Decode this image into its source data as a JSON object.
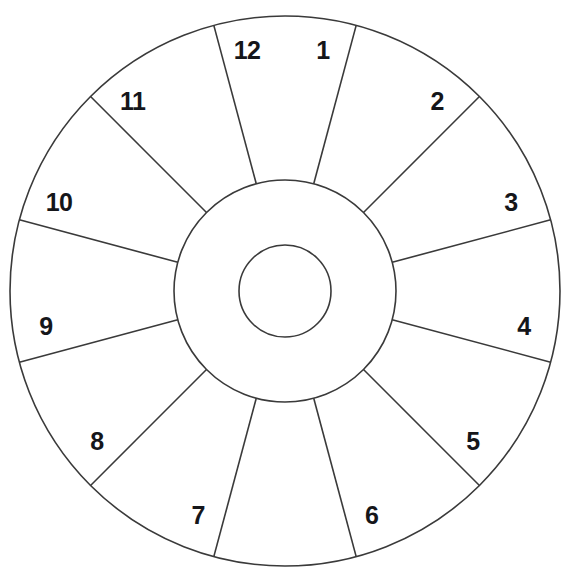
{
  "diagram": {
    "type": "radial-sector-wheel",
    "background_color": "#ffffff",
    "stroke_color": "#3a3a3a",
    "label_color": "#15161a",
    "geometry": {
      "center_x": 285,
      "center_y": 291,
      "outer_radius": 275,
      "middle_radius": 111,
      "inner_radius": 46,
      "sector_count": 12,
      "sector_angle_degrees": 30,
      "first_spoke_offset_degrees": 15
    },
    "rings": [
      {
        "name": "outer-circle",
        "radius": 275
      },
      {
        "name": "middle-circle",
        "radius": 111
      },
      {
        "name": "inner-circle",
        "radius": 46
      }
    ],
    "sectors": [
      {
        "label": "1",
        "spoke_angle_degrees": -75,
        "label_angle_degrees": -81,
        "label_anchor": "start"
      },
      {
        "label": "2",
        "spoke_angle_degrees": -45,
        "label_angle_degrees": -51,
        "label_anchor": "start"
      },
      {
        "label": "3",
        "spoke_angle_degrees": -15,
        "label_angle_degrees": -21,
        "label_anchor": "start"
      },
      {
        "label": "4",
        "spoke_angle_degrees": 15,
        "label_angle_degrees": 9,
        "label_anchor": "start"
      },
      {
        "label": "5",
        "spoke_angle_degrees": 45,
        "label_angle_degrees": 39,
        "label_anchor": "start"
      },
      {
        "label": "6",
        "spoke_angle_degrees": 75,
        "label_angle_degrees": 69,
        "label_anchor": "start"
      },
      {
        "label": "7",
        "spoke_angle_degrees": 105,
        "label_angle_degrees": 111,
        "label_anchor": "end"
      },
      {
        "label": "8",
        "spoke_angle_degrees": 135,
        "label_angle_degrees": 141,
        "label_anchor": "end"
      },
      {
        "label": "9",
        "spoke_angle_degrees": 165,
        "label_angle_degrees": 171,
        "label_anchor": "end"
      },
      {
        "label": "10",
        "spoke_angle_degrees": 195,
        "label_angle_degrees": 201,
        "label_anchor": "end"
      },
      {
        "label": "11",
        "spoke_angle_degrees": 225,
        "label_angle_degrees": 231,
        "label_anchor": "end"
      },
      {
        "label": "12",
        "spoke_angle_degrees": 255,
        "label_angle_degrees": 261,
        "label_anchor": "end"
      }
    ]
  }
}
